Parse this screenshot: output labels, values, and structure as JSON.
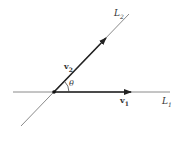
{
  "diagram": {
    "lines": [
      {
        "id": "L1",
        "label": "L",
        "subscript": "1"
      },
      {
        "id": "L2",
        "label": "L",
        "subscript": "2"
      }
    ],
    "vectors": [
      {
        "id": "v1",
        "label": "v",
        "subscript": "1"
      },
      {
        "id": "v2",
        "label": "v",
        "subscript": "2"
      }
    ],
    "angle": {
      "label": "θ"
    },
    "colors": {
      "line": "#8a8a8a",
      "vector": "#222222"
    }
  }
}
